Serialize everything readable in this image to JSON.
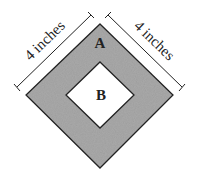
{
  "diagram": {
    "outer_square": {
      "label": "A",
      "fill": "#a9a9a9",
      "stroke": "#222222"
    },
    "inner_square": {
      "label": "B",
      "fill": "#ffffff",
      "stroke": "#222222"
    },
    "dimensions": [
      {
        "side": "upper-left",
        "label": "4 inches"
      },
      {
        "side": "upper-right",
        "label": "4 inches"
      }
    ]
  }
}
